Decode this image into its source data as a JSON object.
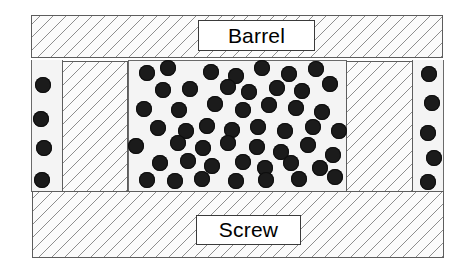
{
  "figure": {
    "canvas": {
      "width": 470,
      "height": 279,
      "background": "#ffffff"
    }
  },
  "colors": {
    "particle": "#1b1b1b",
    "hatch_line": "#8e8e8e",
    "hatch_fill": "#fbfbfb",
    "channel_fill": "#f4f4f4",
    "outline": "#5d5d5d",
    "label_border": "#3a3a3a",
    "label_fill": "#ffffff",
    "text": "#000000"
  },
  "labels": {
    "barrel": "Barrel",
    "screw": "Screw"
  },
  "components": [
    {
      "name": "barrel",
      "kind": "hatched",
      "x": 31,
      "y": 15,
      "w": 412,
      "h": 43
    },
    {
      "name": "screw-root",
      "kind": "hatched",
      "x": 32,
      "y": 191,
      "w": 412,
      "h": 67
    },
    {
      "name": "screw-flight-left",
      "kind": "hatched",
      "x": 62,
      "y": 61,
      "w": 66,
      "h": 131
    },
    {
      "name": "screw-flight-right",
      "kind": "hatched",
      "x": 346,
      "y": 61,
      "w": 67,
      "h": 131
    },
    {
      "name": "solids-channel",
      "kind": "plain",
      "x": 128,
      "y": 60,
      "w": 219,
      "h": 132
    },
    {
      "name": "clearance-gap-left",
      "kind": "plain",
      "x": 31,
      "y": 60,
      "w": 32,
      "h": 132
    },
    {
      "name": "clearance-gap-right",
      "kind": "plain",
      "x": 412,
      "y": 60,
      "w": 32,
      "h": 132
    }
  ],
  "label_boxes": [
    {
      "name": "barrel-label",
      "text_key": "barrel",
      "x": 198,
      "y": 20,
      "w": 117,
      "h": 31,
      "font_size": 21
    },
    {
      "name": "screw-label",
      "text_key": "screw",
      "x": 196,
      "y": 215,
      "w": 105,
      "h": 30,
      "font_size": 21
    }
  ],
  "particles": {
    "diameter": 16,
    "note": "Dark solid pellets; cx/cy are centre coordinates in px",
    "gap_left": [
      {
        "cx": 43,
        "cy": 85
      },
      {
        "cx": 41,
        "cy": 119
      },
      {
        "cx": 44,
        "cy": 148
      },
      {
        "cx": 42,
        "cy": 180
      }
    ],
    "gap_right": [
      {
        "cx": 429,
        "cy": 74
      },
      {
        "cx": 432,
        "cy": 103
      },
      {
        "cx": 428,
        "cy": 133
      },
      {
        "cx": 434,
        "cy": 158
      },
      {
        "cx": 428,
        "cy": 182
      }
    ],
    "channel": [
      {
        "cx": 147,
        "cy": 73
      },
      {
        "cx": 168,
        "cy": 68
      },
      {
        "cx": 211,
        "cy": 72
      },
      {
        "cx": 236,
        "cy": 76
      },
      {
        "cx": 262,
        "cy": 68
      },
      {
        "cx": 289,
        "cy": 74
      },
      {
        "cx": 316,
        "cy": 69
      },
      {
        "cx": 163,
        "cy": 90
      },
      {
        "cx": 190,
        "cy": 89
      },
      {
        "cx": 228,
        "cy": 87
      },
      {
        "cx": 249,
        "cy": 92
      },
      {
        "cx": 277,
        "cy": 88
      },
      {
        "cx": 302,
        "cy": 91
      },
      {
        "cx": 330,
        "cy": 84
      },
      {
        "cx": 144,
        "cy": 109
      },
      {
        "cx": 179,
        "cy": 110
      },
      {
        "cx": 215,
        "cy": 104
      },
      {
        "cx": 243,
        "cy": 110
      },
      {
        "cx": 269,
        "cy": 105
      },
      {
        "cx": 296,
        "cy": 108
      },
      {
        "cx": 322,
        "cy": 112
      },
      {
        "cx": 158,
        "cy": 128
      },
      {
        "cx": 186,
        "cy": 131
      },
      {
        "cx": 207,
        "cy": 126
      },
      {
        "cx": 232,
        "cy": 130
      },
      {
        "cx": 258,
        "cy": 127
      },
      {
        "cx": 285,
        "cy": 131
      },
      {
        "cx": 313,
        "cy": 127
      },
      {
        "cx": 339,
        "cy": 131
      },
      {
        "cx": 136,
        "cy": 146
      },
      {
        "cx": 178,
        "cy": 143
      },
      {
        "cx": 203,
        "cy": 148
      },
      {
        "cx": 228,
        "cy": 143
      },
      {
        "cx": 257,
        "cy": 147
      },
      {
        "cx": 281,
        "cy": 152
      },
      {
        "cx": 308,
        "cy": 145
      },
      {
        "cx": 333,
        "cy": 155
      },
      {
        "cx": 160,
        "cy": 163
      },
      {
        "cx": 188,
        "cy": 161
      },
      {
        "cx": 212,
        "cy": 166
      },
      {
        "cx": 243,
        "cy": 162
      },
      {
        "cx": 265,
        "cy": 168
      },
      {
        "cx": 291,
        "cy": 163
      },
      {
        "cx": 320,
        "cy": 168
      },
      {
        "cx": 147,
        "cy": 180
      },
      {
        "cx": 175,
        "cy": 181
      },
      {
        "cx": 202,
        "cy": 179
      },
      {
        "cx": 236,
        "cy": 181
      },
      {
        "cx": 266,
        "cy": 180
      },
      {
        "cx": 299,
        "cy": 179
      },
      {
        "cx": 335,
        "cy": 177
      }
    ]
  }
}
